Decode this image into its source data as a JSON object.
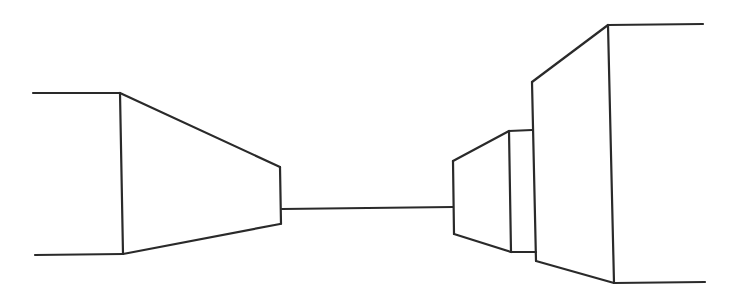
{
  "canvas": {
    "width": 743,
    "height": 289,
    "background": "#ffffff",
    "stroke_color": "#2a2a2a"
  },
  "drawing": {
    "description": "One-point perspective line sketch of blocks along a corridor",
    "left_block": [
      [
        33,
        93,
        120,
        93
      ],
      [
        120,
        93,
        123,
        254
      ],
      [
        35,
        255,
        123,
        254
      ],
      [
        120,
        93,
        280,
        167
      ],
      [
        123,
        254,
        280,
        224
      ],
      [
        280,
        167,
        281,
        224
      ]
    ],
    "horizon_line": [
      [
        282,
        209,
        453,
        207
      ]
    ],
    "right_small_block": [
      [
        453,
        161,
        454,
        234
      ],
      [
        453,
        161,
        509,
        131
      ],
      [
        454,
        234,
        511,
        252
      ],
      [
        509,
        131,
        511,
        252
      ],
      [
        509,
        131,
        532,
        130
      ],
      [
        511,
        252,
        536,
        252
      ]
    ],
    "right_large_block": [
      [
        532,
        82,
        536,
        261
      ],
      [
        532,
        82,
        608,
        25
      ],
      [
        536,
        261,
        614,
        283
      ],
      [
        608,
        25,
        614,
        283
      ],
      [
        608,
        25,
        703,
        24
      ],
      [
        614,
        283,
        705,
        282
      ]
    ]
  }
}
